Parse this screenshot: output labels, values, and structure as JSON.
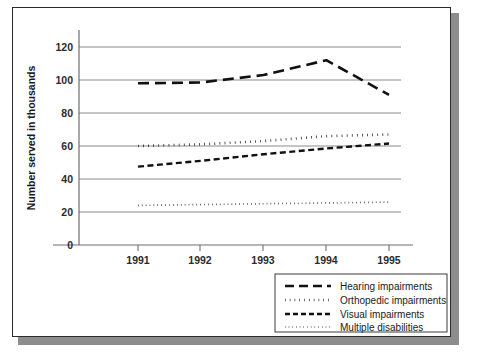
{
  "chart_data": {
    "type": "line",
    "title": "",
    "xlabel": "",
    "ylabel": "Number served in thousands",
    "x": [
      1991,
      1992,
      1993,
      1994,
      1995
    ],
    "xticklabels": [
      "1991",
      "1992",
      "1993",
      "1994",
      "1995"
    ],
    "yticklabels": [
      "0",
      "20",
      "40",
      "60",
      "80",
      "100",
      "120"
    ],
    "yticks": [
      0,
      20,
      40,
      60,
      80,
      100,
      120
    ],
    "ylim": [
      0,
      128
    ],
    "xlim": [
      1990.4,
      1995.6
    ],
    "grid": "horizontal",
    "legend_position": "below-right",
    "series": [
      {
        "name": "Hearing impairments",
        "values": [
          98,
          98.5,
          103,
          112,
          91
        ],
        "dash": "long-dash",
        "color": "#111111",
        "width": 2.6
      },
      {
        "name": "Orthopedic impairments",
        "values": [
          60,
          61,
          63,
          66,
          67
        ],
        "dash": "thick-dot",
        "color": "#111111",
        "width": 2.6
      },
      {
        "name": "Visual impairments",
        "values": [
          47.5,
          51,
          55,
          58.5,
          61.5
        ],
        "dash": "medium-dash",
        "color": "#111111",
        "width": 2.4
      },
      {
        "name": "Multiple disabilities",
        "values": [
          24,
          24.5,
          25,
          25.5,
          26
        ],
        "dash": "fine-dot",
        "color": "#111111",
        "width": 1.7
      }
    ]
  },
  "axes": {
    "y_title": "Number served in thousands",
    "y_labels": {
      "t0": "0",
      "t20": "20",
      "t40": "40",
      "t60": "60",
      "t80": "80",
      "t100": "100",
      "t120": "120"
    },
    "x_labels": {
      "x1991": "1991",
      "x1992": "1992",
      "x1993": "1993",
      "x1994": "1994",
      "x1995": "1995"
    }
  },
  "legend": {
    "items": [
      {
        "label": "Hearing impairments"
      },
      {
        "label": "Orthopedic impairments"
      },
      {
        "label": "Visual impairments"
      },
      {
        "label": "Multiple disabilities"
      }
    ]
  },
  "colors": {
    "ink": "#111111",
    "grid": "#8a8a8a",
    "frame": "#2b2b2b",
    "shadow": "#8d8d8d",
    "background": "#ffffff"
  }
}
